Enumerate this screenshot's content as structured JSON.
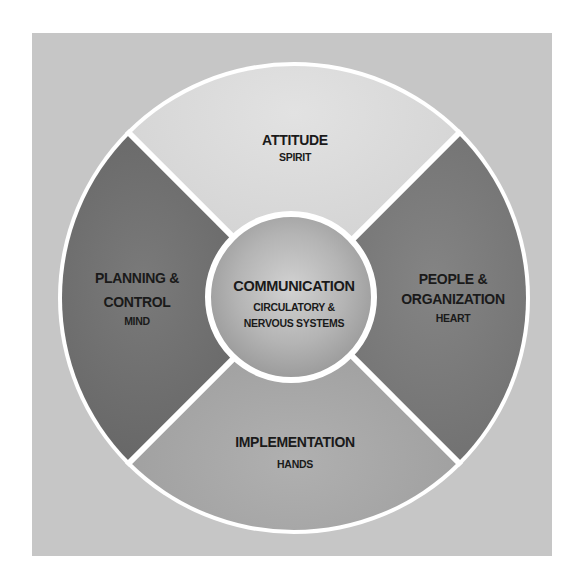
{
  "diagram": {
    "type": "segmented-wheel",
    "colors": {
      "background_square": "#c6c6c6",
      "divider": "#ffffff",
      "top_segment": "#dadada",
      "left_segment": "#6c6c6c",
      "right_segment": "#767676",
      "bottom_segment": "#a4a4a4",
      "center_hub": "#b4b4b4",
      "text": "#1a1a1a"
    },
    "center": {
      "title": "COMMUNICATION",
      "subtitle_line1": "CIRCULATORY &",
      "subtitle_line2": "NERVOUS SYSTEMS"
    },
    "segments": {
      "top": {
        "title": "ATTITUDE",
        "subtitle": "SPIRIT"
      },
      "left": {
        "title_line1": "PLANNING &",
        "title_line2": "CONTROL",
        "subtitle": "MIND"
      },
      "right": {
        "title_line1": "PEOPLE &",
        "title_line2": "ORGANIZATION",
        "subtitle": "HEART"
      },
      "bottom": {
        "title": "IMPLEMENTATION",
        "subtitle": "HANDS"
      }
    }
  }
}
